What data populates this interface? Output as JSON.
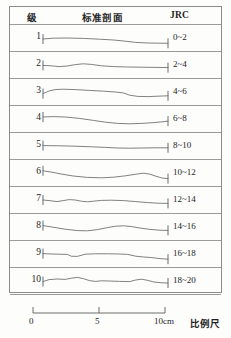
{
  "header": {
    "grade_label": "级",
    "profile_label": "标准剖面",
    "jrc_label": "JRC"
  },
  "rows": [
    {
      "grade": "1",
      "jrc": "0~2",
      "path": "M0,14 L10,13.2 L24,13.0 L40,13.4 L56,14.2 L70,15.0 L80,16.0 L92,17.4 L104,18.0 L116,18.2 L124,18.3"
    },
    {
      "grade": "2",
      "jrc": "2~4",
      "path": "M0,13.4 L8,13.8 L16,14.6 L24,14.0 L32,12.6 L40,11.8 L48,12.4 L58,13.8 L70,14.6 L84,15.0 L98,15.2 L112,15.4 L124,15.6"
    },
    {
      "grade": "3",
      "jrc": "4~6",
      "path": "M0,14.6 L6,12.0 L12,10.6 L20,10.2 L32,10.6 L46,11.4 L60,12.2 L72,13.0 L80,14.0 L86,16.2 L94,17.4 L104,17.6 L114,17.2 L124,16.8"
    },
    {
      "grade": "4",
      "jrc": "6~8",
      "path": "M0,11.0 L10,10.6 L22,11.0 L36,12.4 L50,14.4 L62,16.2 L74,17.4 L86,17.8 L98,17.4 L110,16.6 L118,15.8 L124,15.2"
    },
    {
      "grade": "5",
      "jrc": "8~10",
      "path": "M0,12.6 L16,12.8 L32,13.2 L48,13.8 L62,14.4 L74,15.0 L86,15.2 L98,15.0 L110,14.8 L124,14.8"
    },
    {
      "grade": "6",
      "jrc": "10~12",
      "path": "M0,10.8 L8,12.0 L18,14.0 L30,16.0 L44,17.4 L58,17.8 L70,17.2 L82,15.8 L92,14.2 L100,13.2 L106,14.2 L112,16.2 L118,18.0 L124,18.6"
    },
    {
      "grade": "7",
      "jrc": "12~14",
      "path": "M0,13.0 L8,13.8 L14,14.6 L20,13.6 L26,12.6 L32,13.0 L38,14.2 L44,14.8 L50,14.2 L58,13.4 L68,13.2 L80,13.6 L92,14.6 L104,15.6 L114,16.2 L124,16.4"
    },
    {
      "grade": "8",
      "jrc": "14~16",
      "path": "M0,11.6 L10,13.2 L22,15.2 L34,16.6 L44,16.8 L54,15.6 L64,13.6 L72,12.2 L80,11.8 L88,12.6 L96,14.0 L106,15.4 L116,16.2 L124,16.4"
    },
    {
      "grade": "9",
      "jrc": "16~18",
      "path": "M0,12.6 L8,13.0 L16,13.2 L24,13.4 L28,15.2 L34,15.4 L42,13.2 L52,12.8 L64,12.8 L76,13.0 L84,13.4 L92,15.2 L100,16.0 L108,16.6 L116,17.6 L124,18.2"
    },
    {
      "grade": "10",
      "jrc": "18~20",
      "path": "M0,13.6 L6,11.6 L14,11.0 L22,11.4 L28,10.2 L34,9.4 L40,10.6 L46,12.6 L52,13.4 L58,12.8 L66,13.0 L76,13.4 L86,13.6 L92,12.0 L98,11.2 L104,12.4 L110,14.0 L118,14.8 L124,15.0"
    }
  ],
  "scale": {
    "ticks": [
      "0",
      "5",
      "10cm"
    ],
    "caption": "比例尺"
  },
  "colors": {
    "curve": "#6b6b6b",
    "border": "#8c8c8c",
    "text": "#242424"
  }
}
